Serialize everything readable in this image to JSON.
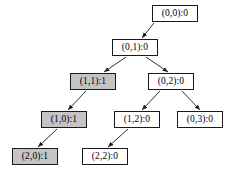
{
  "diagram": {
    "type": "tree",
    "background_color": "#ffffff",
    "node_border_color": "#1a1a1a",
    "node_fill_default": "#ffffff",
    "node_fill_shaded": "#c4c4c4",
    "edge_color": "#1a1a1a",
    "nodes": [
      {
        "id": "n00",
        "label": "(0,0):0",
        "state": "(0,0)",
        "value": "0",
        "shaded": false,
        "x": 152,
        "y": 5,
        "w": 46,
        "h": 17
      },
      {
        "id": "n01",
        "label": "(0,1):0",
        "state": "(0,1)",
        "value": "0",
        "shaded": false,
        "x": 112,
        "y": 39,
        "w": 46,
        "h": 17
      },
      {
        "id": "n11",
        "label": "(1,1):1",
        "state": "(1,1)",
        "value": "1",
        "shaded": true,
        "x": 70,
        "y": 73,
        "w": 46,
        "h": 17
      },
      {
        "id": "n02",
        "label": "(0,2):0",
        "state": "(0,2)",
        "value": "0",
        "shaded": false,
        "x": 148,
        "y": 73,
        "w": 46,
        "h": 17
      },
      {
        "id": "n10",
        "label": "(1,0):1",
        "state": "(1,0)",
        "value": "1",
        "shaded": true,
        "x": 41,
        "y": 111,
        "w": 46,
        "h": 17
      },
      {
        "id": "n12",
        "label": "(1,2):0",
        "state": "(1,2)",
        "value": "0",
        "shaded": false,
        "x": 114,
        "y": 111,
        "w": 46,
        "h": 17
      },
      {
        "id": "n03",
        "label": "(0,3):0",
        "state": "(0,3)",
        "value": "0",
        "shaded": false,
        "x": 177,
        "y": 111,
        "w": 46,
        "h": 17
      },
      {
        "id": "n20",
        "label": "(2,0):1",
        "state": "(2,0)",
        "value": "1",
        "shaded": true,
        "x": 12,
        "y": 148,
        "w": 46,
        "h": 17
      },
      {
        "id": "n22",
        "label": "(2,2):0",
        "state": "(2,2)",
        "value": "0",
        "shaded": false,
        "x": 82,
        "y": 148,
        "w": 46,
        "h": 17
      }
    ],
    "edges": [
      {
        "from": "n00",
        "to": "n01",
        "x1": 154,
        "y1": 23,
        "x2": 142,
        "y2": 38
      },
      {
        "from": "n01",
        "to": "n11",
        "x1": 126,
        "y1": 57,
        "x2": 104,
        "y2": 72
      },
      {
        "from": "n01",
        "to": "n02",
        "x1": 146,
        "y1": 57,
        "x2": 168,
        "y2": 72
      },
      {
        "from": "n11",
        "to": "n10",
        "x1": 86,
        "y1": 91,
        "x2": 68,
        "y2": 110
      },
      {
        "from": "n02",
        "to": "n12",
        "x1": 160,
        "y1": 91,
        "x2": 142,
        "y2": 110
      },
      {
        "from": "n02",
        "to": "n03",
        "x1": 182,
        "y1": 91,
        "x2": 200,
        "y2": 110
      },
      {
        "from": "n10",
        "to": "n20",
        "x1": 57,
        "y1": 129,
        "x2": 38,
        "y2": 147
      },
      {
        "from": "n12",
        "to": "n22",
        "x1": 128,
        "y1": 129,
        "x2": 108,
        "y2": 147
      }
    ]
  }
}
